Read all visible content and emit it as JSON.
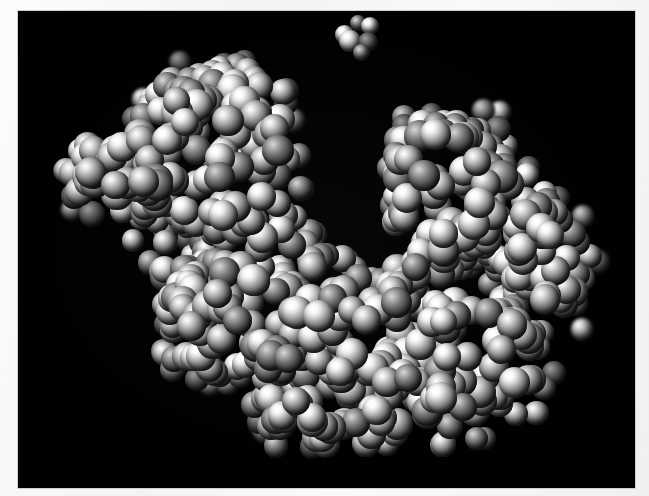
{
  "figure": {
    "kind": "molecular-space-filling-model",
    "title": "",
    "caption": "",
    "background_color": "#010101",
    "page_color": "#f7f7f5",
    "canvas": {
      "x": 18,
      "y": 11,
      "width": 617,
      "height": 477
    },
    "rendering": {
      "style": "CPK space-filling spheres",
      "color_mode": "grayscale",
      "light_direction": "upper-left",
      "specular_highlight": "#ffffff",
      "shadow_color": "#050505"
    },
    "objects": [
      {
        "name": "main-macromolecule",
        "label": "",
        "description": "Large bilobed globular macromolecule with a central cleft",
        "bounds": {
          "x": 55,
          "y": 48,
          "width": 540,
          "height": 407
        },
        "atom_count": 612
      },
      {
        "name": "ligand-cluster",
        "label": "",
        "description": "Small detached cluster of spheres above the macromolecule",
        "bounds": {
          "x": 345,
          "y": 22,
          "width": 44,
          "height": 40
        },
        "atom_count": 6
      }
    ],
    "features": [
      {
        "name": "left-lobe",
        "position": "upper-left"
      },
      {
        "name": "right-lobe",
        "position": "upper-right"
      },
      {
        "name": "central-cleft",
        "position": "center"
      },
      {
        "name": "lower-body",
        "position": "bottom-center"
      }
    ]
  },
  "chart_data": {
    "type": "scatter",
    "xlabel": "",
    "ylabel": "",
    "xlim": [
      0,
      617
    ],
    "ylim": [
      0,
      477
    ],
    "grid": false,
    "legend": "none",
    "series": [
      {
        "name": "ligand-cluster",
        "marker": "sphere",
        "count": 6,
        "points": [
          [
            344,
            26,
            19,
            "bright"
          ],
          [
            358,
            15,
            16,
            "dim"
          ],
          [
            370,
            18,
            18,
            "bright"
          ],
          [
            350,
            33,
            22,
            "bright"
          ],
          [
            368,
            34,
            20,
            "deep"
          ],
          [
            361,
            44,
            17,
            "dim"
          ]
        ]
      },
      {
        "name": "main-macromolecule",
        "marker": "sphere",
        "count": 612,
        "diameter_range": [
          18,
          30
        ]
      }
    ]
  }
}
